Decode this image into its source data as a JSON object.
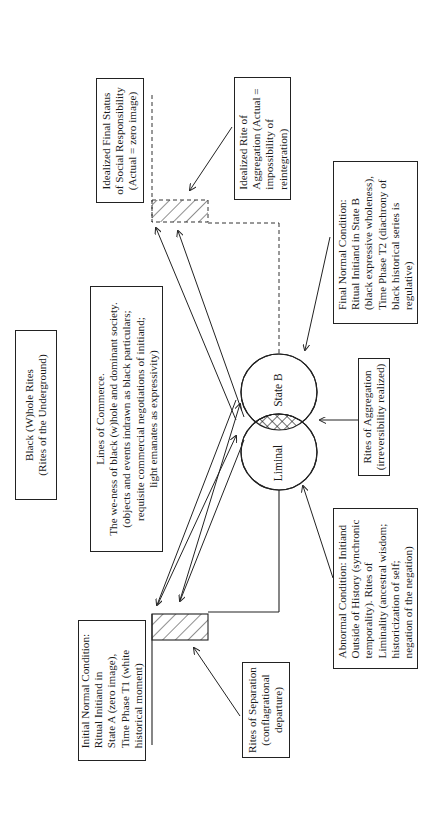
{
  "title_box": {
    "lines": [
      "Black (W)hole Rites",
      "(Rites of the Underground)"
    ]
  },
  "initial_condition": {
    "lines": [
      "Initial Normal Condition:",
      "Ritual Initiand in",
      "State A (zero image),",
      "Time Phase T1 (white",
      "historical moment)"
    ]
  },
  "lines_of_commerce": {
    "lines": [
      "Lines of Commerce.",
      "The we-ness of black (w)hole and dominant society.",
      "(objects and events indrawn as black particulars;",
      "requisite commercial negotiations of initiand;",
      "light emanates as expressivity)"
    ]
  },
  "idealized_final_status": {
    "lines": [
      "Idealized Final Status",
      "of Social Responsibility",
      "(Actual  =  zero image)"
    ]
  },
  "idealized_rite_aggregation": {
    "lines": [
      "Idealized Rite of",
      "Aggregation (Actual =",
      "impossibility of",
      "reintegration)"
    ]
  },
  "final_condition": {
    "lines": [
      "Final Normal Condition:",
      "Ritual Initiand in State B",
      "(black expressive wholeness),",
      "Time Phase T2 (diachrony of",
      "black historical series is",
      "regulative)"
    ]
  },
  "rites_of_aggregation": {
    "lines": [
      "Rites of Aggregation",
      "(irreversibility realized)"
    ]
  },
  "abnormal_condition": {
    "lines": [
      "Abnormal Condition: Initiand",
      "Outside of History (synchronic",
      "temporality). Rites of",
      "Liminality (ancestral wisdom;",
      "historicization of self;",
      "negation of the negation)"
    ]
  },
  "rites_of_separation": {
    "lines": [
      "Rites of Separation",
      "(conflagrational",
      "departure)"
    ]
  },
  "venn": {
    "upper_label": "State B",
    "lower_label": "Liminal"
  },
  "colors": {
    "ink": "#222222",
    "background": "#ffffff"
  }
}
